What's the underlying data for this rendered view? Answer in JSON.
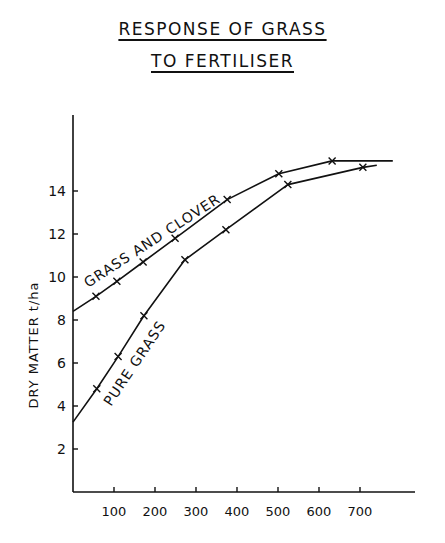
{
  "title_line1": "RESPONSE OF GRASS",
  "title_line2": "TO FERTILISER",
  "chart_data": {
    "type": "line",
    "xlabel": "",
    "ylabel": "DRY MATTER t/ha",
    "xlim": [
      0,
      800
    ],
    "ylim": [
      0,
      17
    ],
    "x_ticks": [
      100,
      200,
      300,
      400,
      500,
      600,
      700
    ],
    "y_ticks": [
      2,
      4,
      6,
      8,
      10,
      12,
      14
    ],
    "grid": false,
    "legend": "inline labels along curves",
    "series": [
      {
        "name": "GRASS AND CLOVER",
        "line": [
          [
            0,
            8.4
          ],
          [
            56,
            9.1
          ],
          [
            107,
            9.8
          ],
          [
            171,
            10.7
          ],
          [
            249,
            11.8
          ],
          [
            376,
            13.6
          ],
          [
            502,
            14.8
          ],
          [
            632,
            15.4
          ],
          [
            780,
            15.4
          ]
        ],
        "markers": [
          [
            56,
            9.1
          ],
          [
            107,
            9.8
          ],
          [
            171,
            10.7
          ],
          [
            249,
            11.8
          ],
          [
            376,
            13.6
          ],
          [
            502,
            14.8
          ],
          [
            632,
            15.4
          ]
        ]
      },
      {
        "name": "PURE GRASS",
        "line": [
          [
            0,
            3.25
          ],
          [
            58,
            4.8
          ],
          [
            110,
            6.3
          ],
          [
            173,
            8.2
          ],
          [
            273,
            10.8
          ],
          [
            373,
            12.2
          ],
          [
            524,
            14.3
          ],
          [
            707,
            15.1
          ],
          [
            741,
            15.2
          ]
        ],
        "markers": [
          [
            58,
            4.8
          ],
          [
            110,
            6.3
          ],
          [
            173,
            8.2
          ],
          [
            273,
            10.8
          ],
          [
            373,
            12.2
          ],
          [
            524,
            14.3
          ],
          [
            707,
            15.1
          ]
        ]
      }
    ]
  }
}
